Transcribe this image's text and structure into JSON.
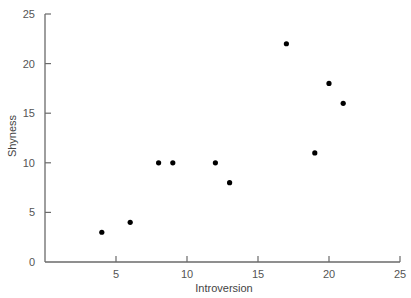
{
  "chart_data": {
    "type": "scatter",
    "title": "",
    "xlabel": "Introversion",
    "ylabel": "Shyness",
    "xlim": [
      0,
      25
    ],
    "ylim": [
      0,
      25
    ],
    "xticks": [
      5,
      10,
      15,
      20,
      25
    ],
    "yticks": [
      0,
      5,
      10,
      15,
      20,
      25
    ],
    "grid": false,
    "legend": null,
    "marker_color": "#000000",
    "axis_color": "#6a6a6a",
    "points": [
      {
        "x": 4,
        "y": 3
      },
      {
        "x": 6,
        "y": 4
      },
      {
        "x": 8,
        "y": 10
      },
      {
        "x": 9,
        "y": 10
      },
      {
        "x": 12,
        "y": 10
      },
      {
        "x": 13,
        "y": 8
      },
      {
        "x": 17,
        "y": 22
      },
      {
        "x": 19,
        "y": 11
      },
      {
        "x": 20,
        "y": 18
      },
      {
        "x": 21,
        "y": 16
      }
    ]
  }
}
